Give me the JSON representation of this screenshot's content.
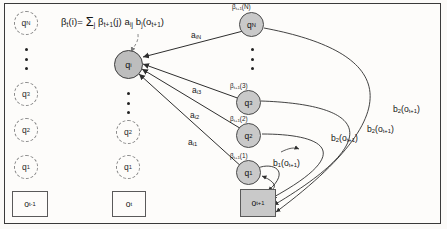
{
  "figure": {
    "equation": {
      "lhs_beta": "β",
      "lhs_sub": "t",
      "lhs_arg": "(i)=",
      "sigma": "Σ",
      "sigma_sub": "j",
      "term_beta": "β",
      "term_beta_sub": "t+1",
      "term_beta_arg": "(j)",
      "term_a": "a",
      "term_a_sub": "ij",
      "term_b": "b",
      "term_b_sub": "j",
      "term_b_arg": "(o",
      "term_b_arg_sub": "t+1",
      "term_b_close": ")",
      "full_text": "βt(i)= Σj βt+1(j) aij bj(ot+1)"
    },
    "columns": [
      {
        "name": "column-t-minus-1",
        "observation": {
          "base": "o",
          "sub": "t-1"
        },
        "states": [
          {
            "base": "q",
            "sub": "N",
            "style": "dashed"
          },
          {
            "base": "q",
            "sub": "3",
            "style": "dashed"
          },
          {
            "base": "q",
            "sub": "2",
            "style": "dashed"
          },
          {
            "base": "q",
            "sub": "1",
            "style": "dashed"
          }
        ],
        "ellipsis": true
      },
      {
        "name": "column-t",
        "observation": {
          "base": "o",
          "sub": "t"
        },
        "states": [
          {
            "base": "q",
            "sub": "i",
            "style": "solid-highlight"
          },
          {
            "base": "q",
            "sub": "2",
            "style": "dashed"
          },
          {
            "base": "q",
            "sub": "1",
            "style": "dashed"
          }
        ],
        "ellipsis": true
      },
      {
        "name": "column-t-plus-1",
        "observation": {
          "base": "o",
          "sub": "t+1"
        },
        "states": [
          {
            "base": "q",
            "sub": "N",
            "style": "solid",
            "beta": {
              "base": "β",
              "sub": "t+1",
              "arg": "(N)"
            }
          },
          {
            "base": "q",
            "sub": "3",
            "style": "solid",
            "beta": {
              "base": "β",
              "sub": "t+1",
              "arg": "(3)"
            }
          },
          {
            "base": "q",
            "sub": "2",
            "style": "solid",
            "beta": {
              "base": "β",
              "sub": "t+1",
              "arg": "(2)"
            }
          },
          {
            "base": "q",
            "sub": "1",
            "style": "solid",
            "beta": {
              "base": "β",
              "sub": "t+1",
              "arg": "(1)"
            }
          }
        ],
        "ellipsis": true
      }
    ],
    "transition_labels": [
      {
        "base": "a",
        "sub": "iN"
      },
      {
        "base": "a",
        "sub": "i3"
      },
      {
        "base": "a",
        "sub": "i2"
      },
      {
        "base": "a",
        "sub": "i1"
      }
    ],
    "emission_labels": [
      {
        "base": "b",
        "sub": "1",
        "arg_open": "(o",
        "arg_sub": "t+1",
        "arg_close": ")"
      },
      {
        "base": "b",
        "sub": "2",
        "arg_open": "(o",
        "arg_sub": "t+1",
        "arg_close": ")"
      },
      {
        "base": "b",
        "sub": "2",
        "arg_open": "(o",
        "arg_sub": "t+1",
        "arg_close": ")"
      },
      {
        "base": "b",
        "sub": "2",
        "arg_open": "(o",
        "arg_sub": "t+1",
        "arg_close": ")"
      }
    ],
    "colors": {
      "node_fill": "#c9c9c9",
      "node_stroke": "#4a4a4a",
      "dashed_stroke": "#8a8a8a",
      "line": "#3b3b3b",
      "dashed_pointer": "#7a7a7a",
      "background": "#fdfcfa",
      "frame": "#3a3a3a"
    }
  }
}
